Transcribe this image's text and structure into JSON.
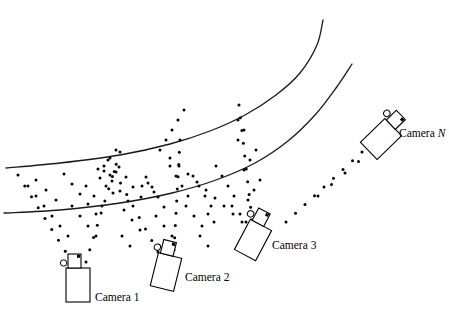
{
  "figure": {
    "type": "diagram",
    "background_color": "#ffffff",
    "stroke_color": "#000000",
    "width": 449,
    "height": 327
  },
  "road": {
    "label": "curved-road-edges",
    "stroke_color": "#1a1a1a",
    "stroke_width": 1.3,
    "edges": [
      {
        "name": "outer-road-edge",
        "points": [
          [
            6,
            168
          ],
          [
            60,
            163
          ],
          [
            120,
            155
          ],
          [
            170,
            144
          ],
          [
            210,
            131
          ],
          [
            245,
            115
          ],
          [
            276,
            95
          ],
          [
            300,
            73
          ],
          [
            317,
            45
          ],
          [
            323,
            20
          ]
        ]
      },
      {
        "name": "inner-road-edge",
        "points": [
          [
            4,
            213
          ],
          [
            60,
            210
          ],
          [
            120,
            203
          ],
          [
            172,
            193
          ],
          [
            216,
            180
          ],
          [
            255,
            163
          ],
          [
            288,
            141
          ],
          [
            315,
            115
          ],
          [
            336,
            88
          ],
          [
            352,
            64
          ]
        ]
      }
    ]
  },
  "cameras": [
    {
      "id": "camera-1",
      "label_prefix": "Camera",
      "label_index": "1",
      "index_italic": false,
      "x": 78,
      "y": 285,
      "rotation": 0,
      "label_x": 95,
      "label_y": 292
    },
    {
      "id": "camera-2",
      "label_prefix": "Camera",
      "label_index": "2",
      "index_italic": false,
      "x": 166,
      "y": 272,
      "rotation": 14,
      "label_x": 185,
      "label_y": 272
    },
    {
      "id": "camera-3",
      "label_prefix": "Camera",
      "label_index": "3",
      "index_italic": false,
      "x": 253,
      "y": 240,
      "rotation": 28,
      "label_x": 272,
      "label_y": 240
    },
    {
      "id": "camera-n",
      "label_prefix": "Camera",
      "label_index": "N",
      "index_italic": true,
      "x": 381,
      "y": 139,
      "rotation": 46,
      "label_x": 399,
      "label_y": 128
    }
  ],
  "camera_icon": {
    "name": "video-camera-icon",
    "body_width": 24,
    "body_height": 34,
    "lens_width": 13,
    "lens_height": 14,
    "reel_radius": 3.2,
    "fill": "#ffffff",
    "stroke": "#000000"
  },
  "rays": {
    "description": "dotted sight-lines radiating from each camera across the road",
    "dot_radius": 1.5,
    "dot_color": "#000000",
    "lines": [
      {
        "name": "camera-1-ray-left",
        "from": [
          72,
          262
        ],
        "to": [
          18,
          175
        ],
        "dots": 9
      },
      {
        "name": "camera-1-ray-right",
        "from": [
          86,
          262
        ],
        "to": [
          120,
          152
        ],
        "dots": 10
      },
      {
        "name": "camera-2-ray-left",
        "from": [
          158,
          252
        ],
        "to": [
          108,
          160
        ],
        "dots": 9
      },
      {
        "name": "camera-2-ray-right",
        "from": [
          174,
          250
        ],
        "to": [
          180,
          140
        ],
        "dots": 10
      },
      {
        "name": "camera-3-ray-left",
        "from": [
          242,
          222
        ],
        "to": [
          170,
          158
        ],
        "dots": 9
      },
      {
        "name": "camera-3-ray-right",
        "from": [
          252,
          220
        ],
        "to": [
          239,
          105
        ],
        "dots": 10
      },
      {
        "name": "camera-n-ray-left",
        "from": [
          362,
          152
        ],
        "to": [
          286,
          222
        ],
        "dots": 9
      },
      {
        "name": "camera-n-ray-up",
        "from": [
          372,
          150
        ],
        "to": [
          318,
          196
        ],
        "dots": 5
      }
    ],
    "scatter": [
      [
        28,
        186
      ],
      [
        36,
        196
      ],
      [
        44,
        206
      ],
      [
        52,
        216
      ],
      [
        60,
        226
      ],
      [
        68,
        236
      ],
      [
        64,
        174
      ],
      [
        72,
        184
      ],
      [
        80,
        194
      ],
      [
        88,
        204
      ],
      [
        96,
        214
      ],
      [
        104,
        171
      ],
      [
        112,
        181
      ],
      [
        120,
        191
      ],
      [
        128,
        201
      ],
      [
        100,
        178
      ],
      [
        106,
        186
      ],
      [
        113,
        193
      ],
      [
        119,
        167
      ],
      [
        126,
        177
      ],
      [
        133,
        187
      ],
      [
        141,
        197
      ],
      [
        146,
        177
      ],
      [
        152,
        187
      ],
      [
        158,
        197
      ],
      [
        164,
        207
      ],
      [
        170,
        166
      ],
      [
        176,
        176
      ],
      [
        182,
        186
      ],
      [
        188,
        196
      ],
      [
        193,
        176
      ],
      [
        199,
        186
      ],
      [
        205,
        196
      ],
      [
        211,
        206
      ],
      [
        216,
        166
      ],
      [
        222,
        176
      ],
      [
        228,
        186
      ],
      [
        234,
        196
      ],
      [
        98,
        169
      ],
      [
        104,
        166
      ],
      [
        110,
        175
      ],
      [
        116,
        172
      ],
      [
        142,
        186
      ],
      [
        148,
        183
      ],
      [
        154,
        192
      ],
      [
        232,
        206
      ],
      [
        240,
        214
      ],
      [
        246,
        222
      ],
      [
        36,
        180
      ],
      [
        46,
        190
      ],
      [
        56,
        200
      ],
      [
        86,
        186
      ],
      [
        94,
        196
      ],
      [
        102,
        206
      ],
      [
        124,
        210
      ],
      [
        132,
        220
      ],
      [
        140,
        230
      ],
      [
        156,
        216
      ],
      [
        164,
        226
      ],
      [
        172,
        236
      ],
      [
        186,
        206
      ],
      [
        194,
        216
      ],
      [
        202,
        226
      ],
      [
        208,
        214
      ],
      [
        214,
        222
      ],
      [
        248,
        200
      ],
      [
        254,
        190
      ],
      [
        260,
        180
      ],
      [
        244,
        170
      ],
      [
        250,
        160
      ],
      [
        256,
        150
      ],
      [
        238,
        140
      ],
      [
        244,
        130
      ],
      [
        238,
        120
      ],
      [
        160,
        150
      ],
      [
        166,
        140
      ],
      [
        172,
        130
      ],
      [
        178,
        120
      ],
      [
        184,
        110
      ],
      [
        110,
        158
      ],
      [
        116,
        150
      ],
      [
        72,
        206
      ],
      [
        80,
        216
      ],
      [
        88,
        226
      ],
      [
        96,
        236
      ],
      [
        122,
        236
      ],
      [
        130,
        246
      ],
      [
        200,
        236
      ],
      [
        208,
        246
      ]
    ]
  }
}
